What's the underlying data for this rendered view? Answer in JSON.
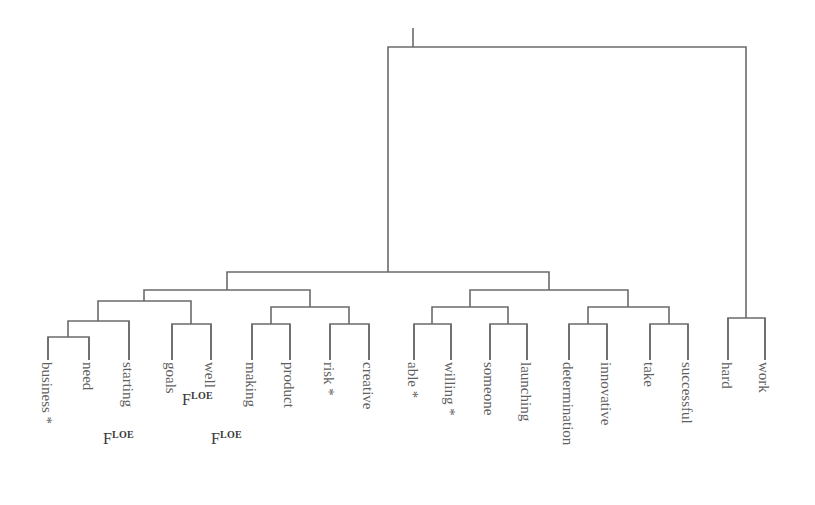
{
  "figure": {
    "kind": "dendrogram",
    "orientation": "top-down",
    "line_color": "#6b6b6b",
    "text_color": "#5f5f5f",
    "background": "#ffffff",
    "line_width": 1.6
  },
  "leaves": [
    {
      "id": "business",
      "label": "business",
      "star": "*",
      "x": 48,
      "stem_top": 337
    },
    {
      "id": "need",
      "label": "need",
      "star": "",
      "x": 89,
      "stem_top": 337
    },
    {
      "id": "starting",
      "label": "starting",
      "star": "",
      "x": 129,
      "stem_top": 321
    },
    {
      "id": "goals",
      "label": "goals",
      "star": "",
      "x": 172,
      "stem_top": 324
    },
    {
      "id": "well",
      "label": "well",
      "star": "",
      "x": 211,
      "stem_top": 324
    },
    {
      "id": "making",
      "label": "making",
      "star": "",
      "x": 252,
      "stem_top": 324
    },
    {
      "id": "product",
      "label": "product",
      "star": "",
      "x": 290,
      "stem_top": 324
    },
    {
      "id": "risk",
      "label": "risk",
      "star": "*",
      "x": 330,
      "stem_top": 324
    },
    {
      "id": "creative",
      "label": "creative",
      "star": "",
      "x": 369,
      "stem_top": 324
    },
    {
      "id": "able",
      "label": "able",
      "star": "*",
      "x": 414,
      "stem_top": 324
    },
    {
      "id": "willing",
      "label": "willing",
      "star": "*",
      "x": 451,
      "stem_top": 324
    },
    {
      "id": "someone",
      "label": "someone",
      "star": "",
      "x": 490,
      "stem_top": 324
    },
    {
      "id": "launching",
      "label": "launching",
      "star": "",
      "x": 527,
      "stem_top": 324
    },
    {
      "id": "determination",
      "label": "determination",
      "star": "",
      "x": 569,
      "stem_top": 324
    },
    {
      "id": "innovative",
      "label": "innovative",
      "star": "",
      "x": 607,
      "stem_top": 324
    },
    {
      "id": "take",
      "label": "take",
      "star": "",
      "x": 650,
      "stem_top": 324
    },
    {
      "id": "successful",
      "label": "successful",
      "star": "",
      "x": 688,
      "stem_top": 324
    },
    {
      "id": "hard",
      "label": "hard",
      "star": "",
      "x": 728,
      "stem_top": 318
    },
    {
      "id": "work",
      "label": "work",
      "star": "",
      "x": 765,
      "stem_top": 318
    }
  ],
  "merges": [
    {
      "id": "m-business-need",
      "left": 48,
      "right": 89,
      "y": 337,
      "left_child_y": 360,
      "right_child_y": 360
    },
    {
      "id": "m-businessneed-starting",
      "left": 68,
      "right": 129,
      "y": 321,
      "left_child_y": 337,
      "right_child_y": 360
    },
    {
      "id": "m-goals-well",
      "left": 172,
      "right": 211,
      "y": 324,
      "left_child_y": 360,
      "right_child_y": 360
    },
    {
      "id": "m-left-pairgroup",
      "left": 98,
      "right": 191,
      "y": 301,
      "left_child_y": 321,
      "right_child_y": 324
    },
    {
      "id": "m-making-product",
      "left": 252,
      "right": 290,
      "y": 324,
      "left_child_y": 360,
      "right_child_y": 360
    },
    {
      "id": "m-risk-creative",
      "left": 330,
      "right": 369,
      "y": 324,
      "left_child_y": 360,
      "right_child_y": 360
    },
    {
      "id": "m-making-risk-group",
      "left": 271,
      "right": 349,
      "y": 307,
      "left_child_y": 324,
      "right_child_y": 324
    },
    {
      "id": "m-clusterA",
      "left": 144,
      "right": 310,
      "y": 290,
      "left_child_y": 301,
      "right_child_y": 307
    },
    {
      "id": "m-able-willing",
      "left": 414,
      "right": 451,
      "y": 324,
      "left_child_y": 360,
      "right_child_y": 360
    },
    {
      "id": "m-someone-launching",
      "left": 490,
      "right": 527,
      "y": 324,
      "left_child_y": 360,
      "right_child_y": 360
    },
    {
      "id": "m-able-someone-group",
      "left": 432,
      "right": 508,
      "y": 307,
      "left_child_y": 324,
      "right_child_y": 324
    },
    {
      "id": "m-determination-innovative",
      "left": 569,
      "right": 607,
      "y": 324,
      "left_child_y": 360,
      "right_child_y": 360
    },
    {
      "id": "m-take-successful",
      "left": 650,
      "right": 688,
      "y": 324,
      "left_child_y": 360,
      "right_child_y": 360
    },
    {
      "id": "m-determination-take-group",
      "left": 588,
      "right": 669,
      "y": 307,
      "left_child_y": 324,
      "right_child_y": 324
    },
    {
      "id": "m-clusterB",
      "left": 470,
      "right": 628,
      "y": 290,
      "left_child_y": 307,
      "right_child_y": 307
    },
    {
      "id": "m-main",
      "left": 227,
      "right": 549,
      "y": 272,
      "left_child_y": 290,
      "right_child_y": 290
    },
    {
      "id": "m-hard-work",
      "left": 728,
      "right": 765,
      "y": 318,
      "left_child_y": 360,
      "right_child_y": 360
    },
    {
      "id": "m-root",
      "left": 388,
      "right": 746,
      "y": 47,
      "left_child_y": 272,
      "right_child_y": 318
    }
  ],
  "root_stem": {
    "x": 413,
    "top": 28,
    "bottom": 47
  },
  "annotations": [
    {
      "id": "floe-starting",
      "base": "F",
      "sup": "LOE",
      "x": 103,
      "y": 430
    },
    {
      "id": "floe-well",
      "base": "F",
      "sup": "LOE",
      "x": 182,
      "y": 391
    },
    {
      "id": "floe-making",
      "base": "F",
      "sup": "LOE",
      "x": 211,
      "y": 430
    }
  ]
}
